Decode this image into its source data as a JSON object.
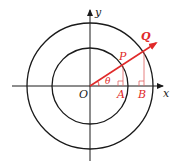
{
  "diagram": {
    "title": "",
    "colors": {
      "axis": "#1a1a1a",
      "circle": "#1a1a1a",
      "accent": "#e02a2a",
      "drop_line": "#e06060"
    },
    "axes": {
      "x_label": "x",
      "y_label": "y",
      "origin_label": "O"
    },
    "circles": [
      {
        "name": "inner-circle",
        "radius": 38
      },
      {
        "name": "outer-circle",
        "radius": 63
      }
    ],
    "points": {
      "P": {
        "label": "P"
      },
      "Q": {
        "label": "Q"
      },
      "A": {
        "label": "A"
      },
      "B": {
        "label": "B"
      }
    },
    "angle": {
      "label": "θ"
    }
  }
}
